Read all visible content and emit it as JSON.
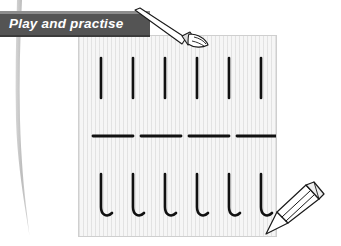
{
  "page": {
    "title": "Play and practise",
    "background_color": "#ffffff",
    "width": 341,
    "height": 246
  },
  "banner": {
    "label": "Play and practise",
    "background_color": "#545454",
    "top_edge_color": "#8d8d8d",
    "text_color": "#ffffff"
  },
  "decoration": {
    "left_brushstroke": {
      "name": "gray-brushstroke",
      "color": "#c9c9c9"
    }
  },
  "worksheet": {
    "name": "handwriting-practice-sheet",
    "paper_color": "#f6f6f6",
    "border_color": "#cfcfcf",
    "rule_color": "#d2d2d2",
    "stroke_color": "#111111",
    "rows": [
      {
        "id": "row-vertical-lines",
        "stroke_type": "vertical-line",
        "count": 6,
        "x_positions": [
          22,
          54,
          86,
          118,
          150,
          182
        ],
        "y_top": 22,
        "y_bottom": 62
      },
      {
        "id": "row-horizontal-dashes",
        "stroke_type": "horizontal-dash",
        "count": 4,
        "x_starts": [
          14,
          62,
          110,
          158
        ],
        "dash_length": 40,
        "y": 100
      },
      {
        "id": "row-cursive-l-hooks",
        "stroke_type": "cursive-l-hook",
        "count": 6,
        "x_positions": [
          22,
          54,
          86,
          118,
          150,
          182
        ],
        "y_top": 138,
        "y_bottom": 180
      }
    ]
  },
  "tools": [
    {
      "id": "paintbrush",
      "name": "paintbrush-icon",
      "handle_color": "#ffffff",
      "outline_color": "#1a1a1a",
      "ferrule_color": "#d8d8d8"
    },
    {
      "id": "crayon",
      "name": "crayon-icon",
      "body_color": "#ffffff",
      "outline_color": "#1a1a1a",
      "band_color": "#e2e2e2"
    }
  ]
}
